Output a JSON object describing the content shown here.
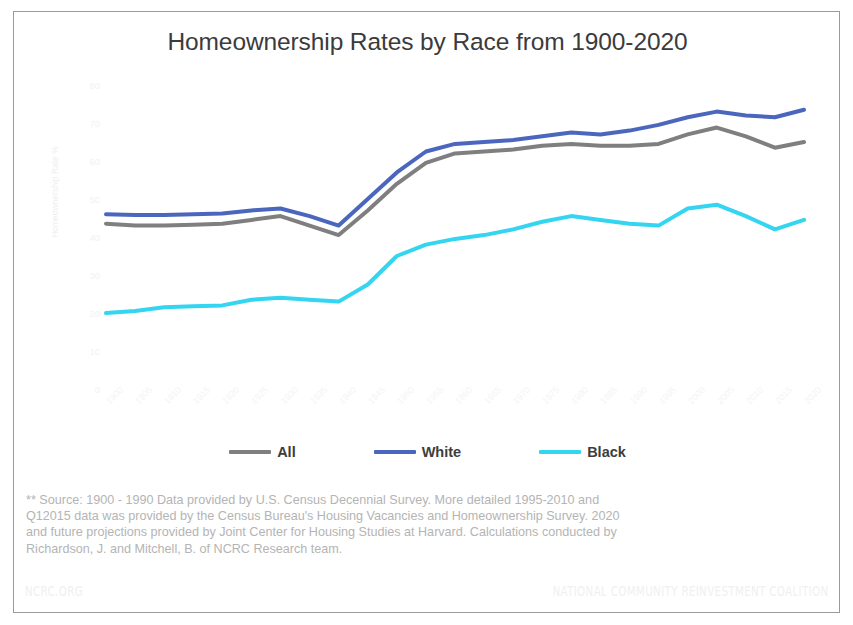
{
  "title": "Homeownership Rates by Race from 1900-2020",
  "colors": {
    "all": "#7f7f7f",
    "white": "#4a67bd",
    "black": "#34d5f0",
    "border": "#9b9b9b",
    "title_text": "#3b3b3b",
    "footnote_text": "#b4b4b4",
    "footer_text": "#f0f0f0"
  },
  "legend": {
    "items": [
      {
        "label": "All",
        "color": "#7f7f7f",
        "swatch": "line-swatch-all"
      },
      {
        "label": "White",
        "color": "#4a67bd",
        "swatch": "line-swatch-white"
      },
      {
        "label": "Black",
        "color": "#34d5f0",
        "swatch": "line-swatch-black"
      }
    ]
  },
  "footnote": {
    "line1": "** Source: 1900 - 1990 Data provided by U.S. Census Decennial Survey. More detailed 1995-2010 and",
    "line2": "Q12015 data was provided by the Census Bureau's Housing Vacancies and Homeownership Survey. 2020",
    "line3": "and future projections provided by Joint Center for Housing Studies at Harvard. Calculations conducted by",
    "line4": "Richardson, J. and Mitchell, B. of NCRC Research team."
  },
  "footer": {
    "left": "NCRC.ORG",
    "right": "NATIONAL COMMUNITY REINVESTMENT COALITION"
  },
  "chart_data": {
    "type": "line",
    "title": "Homeownership Rates by Race from 1900-2020",
    "xlabel": "",
    "ylabel": "Homeownership Rate %",
    "ylim": [
      0,
      80
    ],
    "yticks": [
      0,
      10,
      20,
      30,
      40,
      50,
      60,
      70,
      80
    ],
    "ytick_labels": [
      "0",
      "10",
      "20",
      "30",
      "40",
      "50",
      "60",
      "70",
      "80"
    ],
    "grid": false,
    "legend_position": "bottom",
    "categories": [
      "1900",
      "1905",
      "1910",
      "1915",
      "1920",
      "1925",
      "1930",
      "1935",
      "1940",
      "1945",
      "1950",
      "1955",
      "1960",
      "1965",
      "1970",
      "1975",
      "1980",
      "1985",
      "1990",
      "1995",
      "2000",
      "2005",
      "2010",
      "2015",
      "2020"
    ],
    "series": [
      {
        "name": "All",
        "color": "#7f7f7f",
        "values": [
          43.5,
          43.0,
          43.0,
          43.2,
          43.5,
          44.5,
          45.5,
          43.0,
          40.5,
          47.0,
          54.0,
          59.5,
          62.0,
          62.5,
          63.0,
          64.0,
          64.5,
          64.0,
          64.0,
          64.5,
          67.0,
          68.8,
          66.5,
          63.5,
          65.0
        ]
      },
      {
        "name": "White",
        "color": "#4a67bd",
        "values": [
          46.0,
          45.8,
          45.8,
          46.0,
          46.2,
          47.0,
          47.5,
          45.5,
          43.0,
          50.0,
          57.0,
          62.5,
          64.5,
          65.0,
          65.5,
          66.5,
          67.5,
          67.0,
          68.0,
          69.5,
          71.5,
          73.0,
          72.0,
          71.5,
          73.5
        ]
      },
      {
        "name": "Black",
        "color": "#34d5f0",
        "values": [
          20.0,
          20.5,
          21.5,
          21.8,
          22.0,
          23.5,
          24.0,
          23.5,
          23.0,
          27.5,
          35.0,
          38.0,
          39.5,
          40.5,
          42.0,
          44.0,
          45.5,
          44.5,
          43.5,
          43.0,
          47.5,
          48.5,
          45.5,
          42.0,
          44.5
        ]
      }
    ]
  }
}
